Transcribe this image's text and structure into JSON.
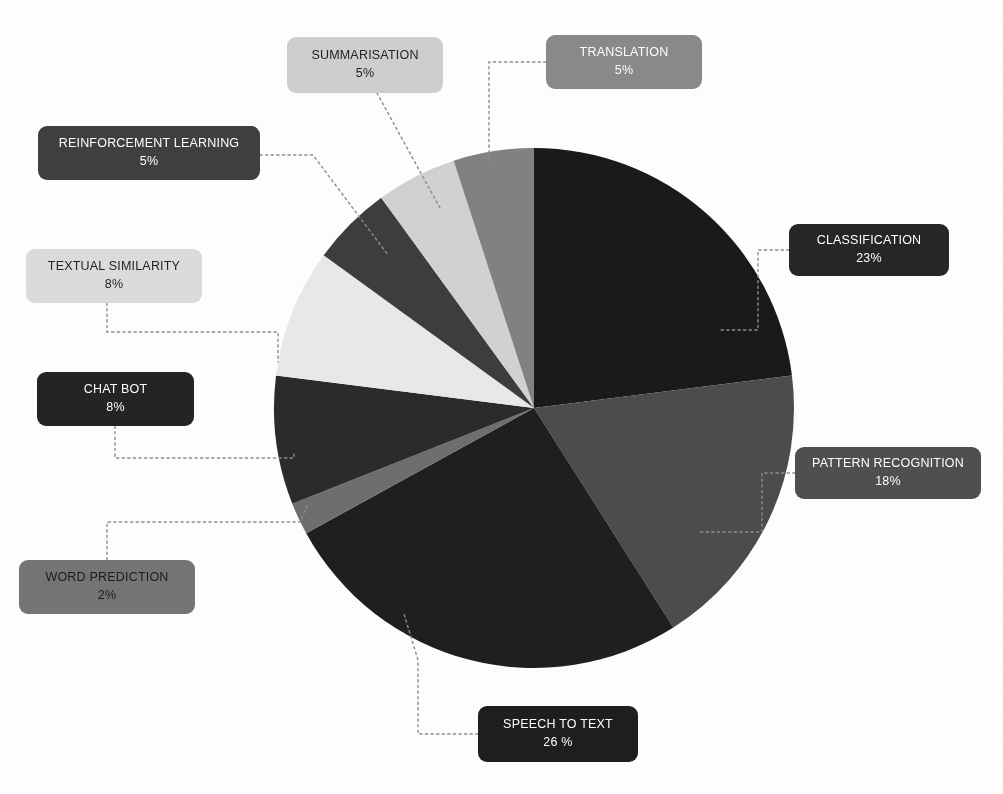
{
  "chart_data": {
    "type": "pie",
    "title": "",
    "subtitle": "",
    "xlabel": "",
    "ylabel": "",
    "legend_position": "callout-labels",
    "grid": false,
    "start_angle_deg": 0,
    "direction": "clockwise",
    "center": {
      "x": 534,
      "y": 408
    },
    "radius": 260,
    "categories": [
      "CLASSIFICATION",
      "PATTERN RECOGNITION",
      "SPEECH TO TEXT",
      "WORD PREDICTION",
      "CHAT BOT",
      "TEXTUAL SIMILARITY",
      "REINFORCEMENT LEARNING",
      "SUMMARISATION",
      "TRANSLATION"
    ],
    "values": [
      23,
      18,
      26,
      2,
      8,
      8,
      5,
      5,
      5
    ],
    "value_labels": [
      "23%",
      "18%",
      "26 %",
      "2%",
      "8%",
      "8%",
      "5%",
      "5%",
      "5%"
    ],
    "colors": [
      "#1a1a1a",
      "#4c4c4c",
      "#1f1f1f",
      "#6e6e6e",
      "#2b2b2b",
      "#e9e9e9",
      "#3d3d3d",
      "#d2d2d2",
      "#828282"
    ],
    "slices": [
      {
        "label": "CLASSIFICATION",
        "value": 23,
        "value_label": "23%",
        "slice_color": "#1a1a1a",
        "box_color": "#262626",
        "text_color": "#ffffff",
        "box": {
          "left": 789,
          "top": 224,
          "width": 160,
          "height": 52
        },
        "leader": [
          [
            789,
            250
          ],
          [
            758,
            250
          ],
          [
            758,
            330
          ],
          [
            718,
            330
          ]
        ]
      },
      {
        "label": "PATTERN RECOGNITION",
        "value": 18,
        "value_label": "18%",
        "slice_color": "#4c4c4c",
        "box_color": "#4f4f4f",
        "text_color": "#ffffff",
        "box": {
          "left": 795,
          "top": 447,
          "width": 186,
          "height": 52
        },
        "leader": [
          [
            795,
            473
          ],
          [
            762,
            473
          ],
          [
            762,
            532
          ],
          [
            700,
            532
          ]
        ]
      },
      {
        "label": "SPEECH TO TEXT",
        "value": 26,
        "value_label": "26 %",
        "slice_color": "#1f1f1f",
        "box_color": "#1e1e1e",
        "text_color": "#ffffff",
        "box": {
          "left": 478,
          "top": 706,
          "width": 160,
          "height": 56
        },
        "leader": [
          [
            478,
            734
          ],
          [
            418,
            734
          ],
          [
            418,
            660
          ],
          [
            404,
            614
          ]
        ]
      },
      {
        "label": "WORD PREDICTION",
        "value": 2,
        "value_label": "2%",
        "slice_color": "#6e6e6e",
        "box_color": "#757575",
        "text_color": "#1c1c1c",
        "box": {
          "left": 19,
          "top": 560,
          "width": 176,
          "height": 54
        },
        "leader": [
          [
            107,
            560
          ],
          [
            107,
            522
          ],
          [
            300,
            522
          ],
          [
            307,
            506
          ]
        ]
      },
      {
        "label": "CHAT BOT",
        "value": 8,
        "value_label": "8%",
        "slice_color": "#2b2b2b",
        "box_color": "#242424",
        "text_color": "#ffffff",
        "box": {
          "left": 37,
          "top": 372,
          "width": 157,
          "height": 54
        },
        "leader": [
          [
            115,
            426
          ],
          [
            115,
            458
          ],
          [
            294,
            458
          ],
          [
            294,
            452
          ]
        ]
      },
      {
        "label": "TEXTUAL SIMILARITY",
        "value": 8,
        "value_label": "8%",
        "slice_color": "#e9e9e9",
        "box_color": "#dcdcdc",
        "text_color": "#232323",
        "box": {
          "left": 26,
          "top": 249,
          "width": 176,
          "height": 54
        },
        "leader": [
          [
            107,
            303
          ],
          [
            107,
            332
          ],
          [
            278,
            332
          ],
          [
            278,
            362
          ]
        ]
      },
      {
        "label": "REINFORCEMENT LEARNING",
        "value": 5,
        "value_label": "5%",
        "slice_color": "#3d3d3d",
        "box_color": "#3f3f3f",
        "text_color": "#ffffff",
        "box": {
          "left": 38,
          "top": 126,
          "width": 222,
          "height": 54
        },
        "leader": [
          [
            260,
            155
          ],
          [
            313,
            155
          ],
          [
            388,
            255
          ]
        ]
      },
      {
        "label": "SUMMARISATION",
        "value": 5,
        "value_label": "5%",
        "slice_color": "#d2d2d2",
        "box_color": "#cfcfcf",
        "text_color": "#232323",
        "box": {
          "left": 287,
          "top": 37,
          "width": 156,
          "height": 56
        },
        "leader": [
          [
            377,
            93
          ],
          [
            440,
            208
          ]
        ]
      },
      {
        "label": "TRANSLATION",
        "value": 5,
        "value_label": "5%",
        "slice_color": "#828282",
        "box_color": "#8a8a8a",
        "text_color": "#ffffff",
        "box": {
          "left": 546,
          "top": 35,
          "width": 156,
          "height": 54
        },
        "leader": [
          [
            546,
            62
          ],
          [
            489,
            62
          ],
          [
            489,
            162
          ]
        ]
      }
    ]
  }
}
